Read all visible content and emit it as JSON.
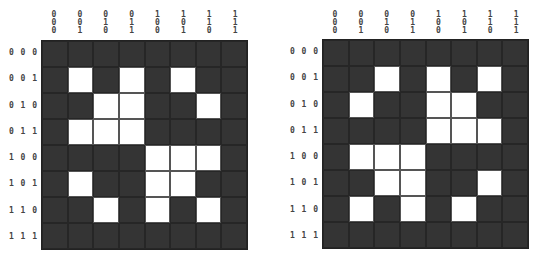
{
  "col_labels": [
    "000",
    "001",
    "010",
    "011",
    "100",
    "101",
    "110",
    "111"
  ],
  "row_labels": [
    "000",
    "001",
    "010",
    "011",
    "100",
    "101",
    "110",
    "111"
  ],
  "colors": {
    "off": "#343434",
    "on": "#ffffff",
    "grid_line": "#262626",
    "label": "#444444"
  },
  "grids": [
    {
      "name": "left",
      "rows": [
        [
          0,
          0,
          0,
          0,
          0,
          0,
          0,
          0
        ],
        [
          0,
          1,
          0,
          1,
          0,
          1,
          0,
          0
        ],
        [
          0,
          0,
          1,
          1,
          0,
          0,
          1,
          0
        ],
        [
          0,
          1,
          1,
          1,
          0,
          0,
          0,
          0
        ],
        [
          0,
          0,
          0,
          0,
          1,
          1,
          1,
          0
        ],
        [
          0,
          1,
          0,
          0,
          1,
          1,
          0,
          0
        ],
        [
          0,
          0,
          1,
          0,
          1,
          0,
          1,
          0
        ],
        [
          0,
          0,
          0,
          0,
          0,
          0,
          0,
          0
        ]
      ]
    },
    {
      "name": "right",
      "rows": [
        [
          0,
          0,
          0,
          0,
          0,
          0,
          0,
          0
        ],
        [
          0,
          0,
          1,
          0,
          1,
          0,
          1,
          0
        ],
        [
          0,
          1,
          0,
          0,
          1,
          1,
          0,
          0
        ],
        [
          0,
          0,
          0,
          0,
          1,
          1,
          1,
          0
        ],
        [
          0,
          1,
          1,
          1,
          0,
          0,
          0,
          0
        ],
        [
          0,
          0,
          1,
          1,
          0,
          0,
          1,
          0
        ],
        [
          0,
          1,
          0,
          1,
          0,
          1,
          0,
          0
        ],
        [
          0,
          0,
          0,
          0,
          0,
          0,
          0,
          0
        ]
      ]
    }
  ]
}
